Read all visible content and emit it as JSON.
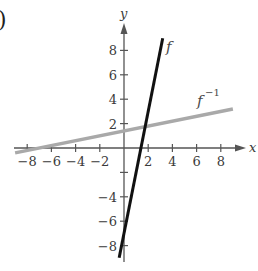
{
  "panel_marker": ")",
  "chart_data": {
    "type": "line",
    "title": "",
    "xlabel": "x",
    "ylabel": "y",
    "xlim": [
      -9,
      9
    ],
    "ylim": [
      -9,
      9
    ],
    "grid": false,
    "x_ticks": [
      -8,
      -6,
      -4,
      -2,
      2,
      4,
      6,
      8
    ],
    "y_ticks": [
      -8,
      -6,
      -4,
      -2,
      2,
      4,
      6,
      8
    ],
    "x_tick_labels": [
      "−8",
      "−6",
      "−4",
      "−2",
      "2",
      "4",
      "6",
      "8"
    ],
    "y_tick_labels": [
      "8",
      "6",
      "4",
      "2",
      "−4",
      "−6",
      "−8"
    ],
    "series": [
      {
        "name": "f",
        "label": "f",
        "formula": "y = 5x - 7",
        "x": [
          -0.4,
          3.2
        ],
        "y": [
          -9,
          9
        ],
        "color": "#111111",
        "width": 3
      },
      {
        "name": "f^-1",
        "label": "f",
        "label_superscript": "−1",
        "formula": "y = (x + 7) / 5",
        "x": [
          -9,
          9
        ],
        "y": [
          -0.4,
          3.2
        ],
        "color": "#a9a9a9",
        "width": 3.5
      }
    ],
    "intersection": [
      1.75,
      1.75
    ]
  }
}
